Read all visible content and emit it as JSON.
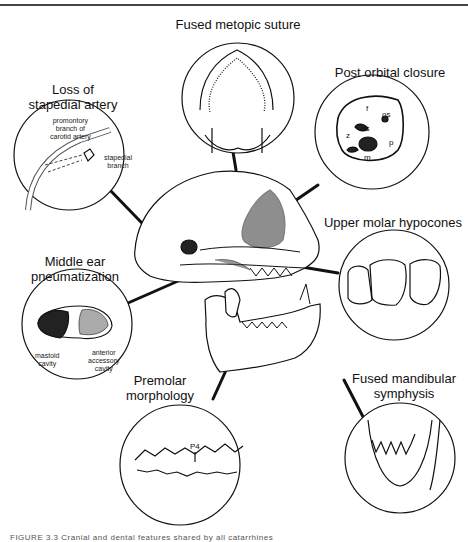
{
  "figure": {
    "caption_partial": "FIGURE 3.3  Cranial and dental features shared by all catarrhines",
    "central_subject": "catarrhine skull (lateral view)"
  },
  "callouts": [
    {
      "id": "metopic",
      "label": "Fused metopic suture"
    },
    {
      "id": "postorbital",
      "label": "Post orbital closure",
      "parts": [
        "f",
        "os",
        "as",
        "z",
        "p",
        "m"
      ]
    },
    {
      "id": "stapedial",
      "label_line1": "Loss of",
      "label_line2": "stapedial artery",
      "annotations": {
        "promontory": "promontory branch of carotid artery",
        "promontory_l1": "promontory",
        "promontory_l2": "branch of",
        "promontory_l3": "carotid artery",
        "stapedial_l1": "stapedial",
        "stapedial_l2": "branch"
      }
    },
    {
      "id": "hypocones",
      "label": "Upper molar hypocones"
    },
    {
      "id": "middleear",
      "label_line1": "Middle ear",
      "label_line2": "pneumatization",
      "annotations": {
        "mastoid_l1": "mastoid",
        "mastoid_l2": "cavity",
        "anterior_l1": "anterior",
        "anterior_l2": "accessory",
        "anterior_l3": "cavity"
      }
    },
    {
      "id": "mandibular",
      "label_line1": "Fused mandibular",
      "label_line2": "symphysis"
    },
    {
      "id": "premolar",
      "label_line1": "Premolar",
      "label_line2": "morphology",
      "tooth_label": "P4"
    }
  ]
}
